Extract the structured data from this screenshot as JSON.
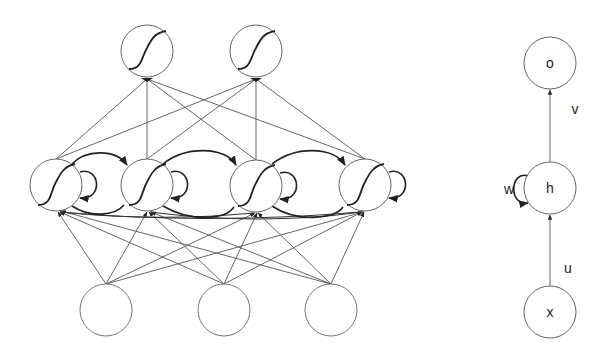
{
  "unfolded_network": {
    "output_nodes": [
      {
        "id": "y1",
        "cx": 147,
        "cy": 51,
        "activation": "sigmoid"
      },
      {
        "id": "y2",
        "cx": 256,
        "cy": 51,
        "activation": "sigmoid"
      }
    ],
    "hidden_nodes": [
      {
        "id": "h1",
        "cx": 56,
        "cy": 185,
        "activation": "sigmoid"
      },
      {
        "id": "h2",
        "cx": 147,
        "cy": 185,
        "activation": "sigmoid"
      },
      {
        "id": "h3",
        "cx": 256,
        "cy": 186,
        "activation": "sigmoid"
      },
      {
        "id": "h4",
        "cx": 365,
        "cy": 185,
        "activation": "sigmoid"
      }
    ],
    "input_nodes": [
      {
        "id": "x1",
        "cx": 106,
        "cy": 310
      },
      {
        "id": "x2",
        "cx": 224,
        "cy": 310
      },
      {
        "id": "x3",
        "cx": 331,
        "cy": 310
      }
    ],
    "node_radius": 26
  },
  "folded_network": {
    "nodes": {
      "output": {
        "label": "o",
        "cx": 550,
        "cy": 63
      },
      "hidden": {
        "label": "h",
        "cx": 550,
        "cy": 188
      },
      "input": {
        "label": "x",
        "cx": 550,
        "cy": 312
      }
    },
    "edges": {
      "hidden_to_output": {
        "label": "v"
      },
      "self_loop": {
        "label": "w"
      },
      "input_to_hidden": {
        "label": "u"
      }
    }
  },
  "colors": {
    "stroke": "#555555",
    "strong_stroke": "#222222",
    "background": "#ffffff"
  }
}
